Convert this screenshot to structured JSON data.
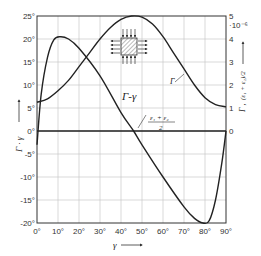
{
  "chart_data": {
    "type": "line",
    "title": "",
    "xlabel": "γ",
    "ylabel_left": "Γ · γ",
    "ylabel_right": "Γ , (ε₁ + ε₂)/2",
    "right_axis_multiplier": "·10⁻⁶",
    "x_ticks": [
      "0°",
      "10°",
      "20°",
      "30°",
      "40°",
      "50°",
      "60°",
      "70°",
      "80°",
      "90°"
    ],
    "y_left_ticks": [
      "25°",
      "20°",
      "15°",
      "10°",
      "5°",
      "0°",
      "-5°",
      "-10°",
      "-15°",
      "-20°"
    ],
    "y_right_ticks": [
      "5",
      "4",
      "3",
      "2",
      "1",
      "0"
    ],
    "xlim": [
      0,
      90
    ],
    "ylim_left": [
      -20,
      25
    ],
    "ylim_right": [
      0,
      5
    ],
    "grid": true,
    "legend": "none (inline curve labels)",
    "series": [
      {
        "name": "Γ-γ",
        "axis": "left",
        "x": [
          0,
          2,
          5,
          8,
          11,
          15,
          20,
          30,
          40,
          46,
          50,
          60,
          70,
          75,
          79,
          82,
          85,
          88,
          90
        ],
        "y": [
          -3,
          8,
          16,
          19.8,
          20.5,
          20,
          18,
          12,
          4,
          0,
          -3,
          -10,
          -16.5,
          -19,
          -20,
          -19.5,
          -15,
          -7,
          0
        ]
      },
      {
        "name": "Γ",
        "axis": "right",
        "x": [
          0,
          5,
          10,
          15,
          20,
          25,
          30,
          35,
          40,
          45,
          50,
          55,
          60,
          65,
          70,
          75,
          80,
          85,
          90
        ],
        "y": [
          1.25,
          1.4,
          1.75,
          2.2,
          2.8,
          3.4,
          4.0,
          4.5,
          4.85,
          5.0,
          4.95,
          4.65,
          4.1,
          3.4,
          2.7,
          2.0,
          1.45,
          1.15,
          1.05
        ]
      },
      {
        "name": "(ε₁+ε₂)/2",
        "axis": "right",
        "x": [
          0,
          90
        ],
        "y": [
          0,
          0
        ]
      }
    ],
    "annotations": [
      {
        "text": "Γ-γ",
        "near_x": 35,
        "near_y_left": 8
      },
      {
        "text": "Γ",
        "near_x": 70,
        "near_y_right": 2.2
      },
      {
        "text": "(ε₁+ε₂)/2",
        "near_x": 60,
        "near_y_left": 1.5
      },
      {
        "text": "inset: hatched square element with arrows (tension/compression) on all sides",
        "near_x": 30,
        "near_y_left": 18
      }
    ]
  },
  "labels": {
    "gamma_curve": "Γ-γ",
    "gamma_curve_right": "Γ",
    "strain_num": "ε₁ + ε₂",
    "strain_den": "2",
    "x_axis": "γ",
    "left_axis": "Γ · γ",
    "right_axis_gamma": "Γ ,",
    "right_axis_strain": "(ε₁ + ε₂)/2",
    "multiplier": "·10⁻⁶"
  }
}
